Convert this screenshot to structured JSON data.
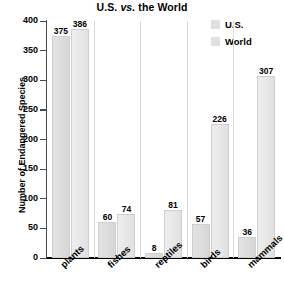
{
  "chart_data": {
    "type": "bar",
    "title": "U.S. vs. the World",
    "title_parts": {
      "before": "U.S. ",
      "italic": "vs.",
      "after": " the World"
    },
    "xlabel": "",
    "ylabel": "Number of Endangered Species",
    "ylim": [
      0,
      400
    ],
    "yticks": [
      0,
      50,
      100,
      150,
      200,
      250,
      300,
      350,
      400
    ],
    "ytick_labels": [
      "0",
      "50",
      "100",
      "150",
      "200",
      "250",
      "300",
      "350",
      "400"
    ],
    "grid": false,
    "legend_position": "top-right",
    "categories": [
      "plants",
      "fishes",
      "reptiles",
      "birds",
      "mammals"
    ],
    "series": [
      {
        "name": "U.S.",
        "color": "#dcdcdc",
        "values": [
          375,
          60,
          8,
          57,
          36
        ]
      },
      {
        "name": "World",
        "color": "#e8e8e8",
        "values": [
          386,
          74,
          81,
          226,
          307
        ]
      }
    ]
  },
  "legend": {
    "items": [
      {
        "label": "U.S.",
        "swatch": "#e0e0e0"
      },
      {
        "label": "World",
        "swatch": "#e0e0e0"
      }
    ]
  },
  "axis": {
    "baseline_color": "#000000",
    "line_color": "#4a4a4a"
  }
}
